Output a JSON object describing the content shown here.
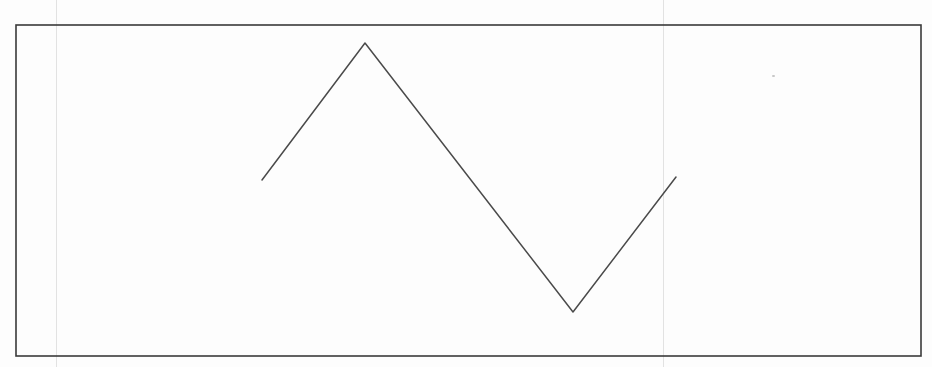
{
  "figure": {
    "width": 932,
    "height": 367,
    "background": "#fdfdfd",
    "frame": {
      "x": 16,
      "y": 25,
      "width": 905,
      "height": 331,
      "stroke": "#3a3a3a",
      "stroke_width": 1.6
    },
    "zigzag": {
      "stroke": "#4a4a4a",
      "stroke_width": 1.5,
      "points": [
        {
          "x": 262,
          "y": 180
        },
        {
          "x": 365,
          "y": 43
        },
        {
          "x": 573,
          "y": 312
        },
        {
          "x": 676,
          "y": 177
        }
      ]
    },
    "scan_artifacts": {
      "guide_lines_x": [
        56,
        663
      ],
      "specks": [
        {
          "x": 772,
          "y": 75
        }
      ]
    }
  }
}
